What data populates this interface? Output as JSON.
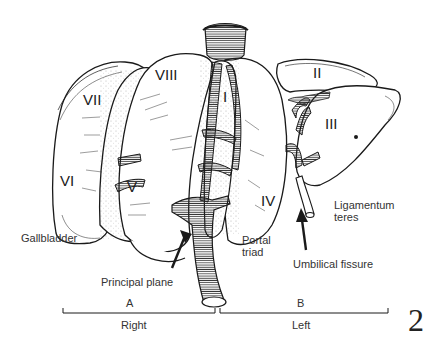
{
  "figure": {
    "number": "2",
    "segments": [
      {
        "id": "I",
        "label": "I"
      },
      {
        "id": "II",
        "label": "II"
      },
      {
        "id": "III",
        "label": "III"
      },
      {
        "id": "IV",
        "label": "IV"
      },
      {
        "id": "V",
        "label": "V"
      },
      {
        "id": "VI",
        "label": "VI"
      },
      {
        "id": "VII",
        "label": "VII"
      },
      {
        "id": "VIII",
        "label": "VIII"
      }
    ],
    "annotations": {
      "gallbladder": "Gallbladder",
      "principal_plane": "Principal plane",
      "portal_triad_1": "Portal",
      "portal_triad_2": "triad",
      "umbilical_fissure": "Umbilical fissure",
      "ligamentum_teres_1": "Ligamentum",
      "ligamentum_teres_2": "teres"
    },
    "brackets": {
      "right": {
        "letter": "A",
        "label": "Right"
      },
      "left": {
        "letter": "B",
        "label": "Left"
      }
    },
    "colors": {
      "ink": "#1a1a1a",
      "background": "#ffffff"
    }
  }
}
